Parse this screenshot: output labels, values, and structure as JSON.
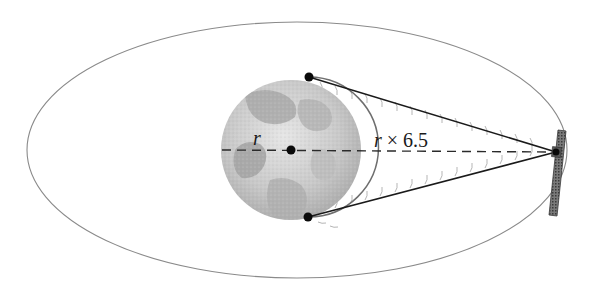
{
  "diagram": {
    "labels": {
      "radius": "r",
      "distance_var": "r",
      "distance_op": "×",
      "distance_factor": "6.5"
    },
    "colors": {
      "orbit": "#8a8a8a",
      "lines": "#1a1a1a",
      "earth_light": "#d9d9d9",
      "earth_dark": "#9a9a9a",
      "signal_arcs": "#b5b5b5"
    },
    "elements": {
      "orbit": "ellipse",
      "earth": "globe",
      "satellite": "satellite-icon",
      "center_point": "dot",
      "tangent_points": [
        "top",
        "bottom"
      ]
    }
  }
}
